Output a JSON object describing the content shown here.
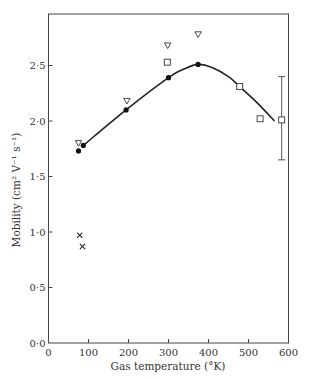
{
  "chart_data": {
    "type": "scatter",
    "title": "",
    "xlabel": "Gas temperature (°K)",
    "ylabel": "Mobility (cm² V⁻¹ s⁻¹)",
    "xlim": [
      0,
      600
    ],
    "ylim": [
      0.0,
      2.95
    ],
    "grid": false,
    "legend": null,
    "x_ticks": [
      0,
      100,
      200,
      300,
      400,
      500,
      600
    ],
    "x_tick_labels": [
      "0",
      "100",
      "200",
      "300",
      "400",
      "500",
      "600"
    ],
    "y_ticks": [
      0.0,
      0.5,
      1.0,
      1.5,
      2.0,
      2.5
    ],
    "y_tick_labels": [
      "0·0",
      "0·5",
      "1·0",
      "1·5",
      "2·0",
      "2·5"
    ],
    "series": [
      {
        "name": "filled circles",
        "marker": "filled-circle",
        "points": [
          [
            75,
            1.73
          ],
          [
            87,
            1.78
          ],
          [
            194,
            2.1
          ],
          [
            300,
            2.39
          ],
          [
            374,
            2.51
          ]
        ]
      },
      {
        "name": "open triangles",
        "marker": "open-triangle-down",
        "points": [
          [
            75,
            1.8
          ],
          [
            196,
            2.18
          ],
          [
            298,
            2.68
          ],
          [
            374,
            2.78
          ]
        ]
      },
      {
        "name": "open squares",
        "marker": "open-square",
        "points": [
          [
            297,
            2.53
          ],
          [
            478,
            2.31
          ],
          [
            529,
            2.02
          ],
          [
            583,
            2.01
          ]
        ]
      },
      {
        "name": "crosses",
        "marker": "x",
        "points": [
          [
            78,
            0.97
          ],
          [
            85,
            0.87
          ]
        ]
      }
    ],
    "error_bars": [
      {
        "x": 583,
        "y": 2.01,
        "low": 1.65,
        "high": 2.4
      }
    ],
    "curve": {
      "name": "fitted curve",
      "points": [
        [
          87,
          1.78
        ],
        [
          194,
          2.1
        ],
        [
          300,
          2.39
        ],
        [
          340,
          2.47
        ],
        [
          374,
          2.51
        ],
        [
          410,
          2.48
        ],
        [
          450,
          2.4
        ],
        [
          478,
          2.31
        ],
        [
          520,
          2.17
        ],
        [
          565,
          2.0
        ]
      ]
    }
  }
}
